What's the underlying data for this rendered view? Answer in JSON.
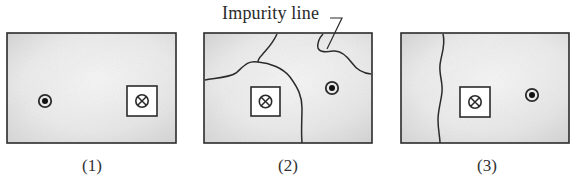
{
  "figure": {
    "annotation_label": "Impurity line",
    "panels": [
      {
        "caption": "(1)",
        "box": {
          "x": 7,
          "y": 33,
          "w": 169,
          "h": 110
        },
        "dot_out_of_page": {
          "cx": 45,
          "cy": 101
        },
        "cross_into_page_square": {
          "x": 127,
          "y": 86,
          "size": 30
        },
        "impurity_lines": []
      },
      {
        "caption": "(2)",
        "box": {
          "x": 204,
          "y": 33,
          "w": 168,
          "h": 110
        },
        "dot_out_of_page": {
          "cx": 332,
          "cy": 88
        },
        "cross_into_page_square": {
          "x": 251,
          "y": 87,
          "size": 29
        },
        "impurity_lines": [
          "line-a",
          "line-b",
          "line-c"
        ]
      },
      {
        "caption": "(3)",
        "box": {
          "x": 401,
          "y": 33,
          "w": 168,
          "h": 110
        },
        "dot_out_of_page": {
          "cx": 532,
          "cy": 95
        },
        "cross_into_page_square": {
          "x": 460,
          "y": 87,
          "size": 30
        },
        "impurity_lines": [
          "line-vertical"
        ]
      }
    ]
  },
  "colors": {
    "stroke": "#2b2b2b",
    "fill_light": "#f2f2f2",
    "fill_dark": "#d6d6d6",
    "square_fill": "#ffffff"
  }
}
